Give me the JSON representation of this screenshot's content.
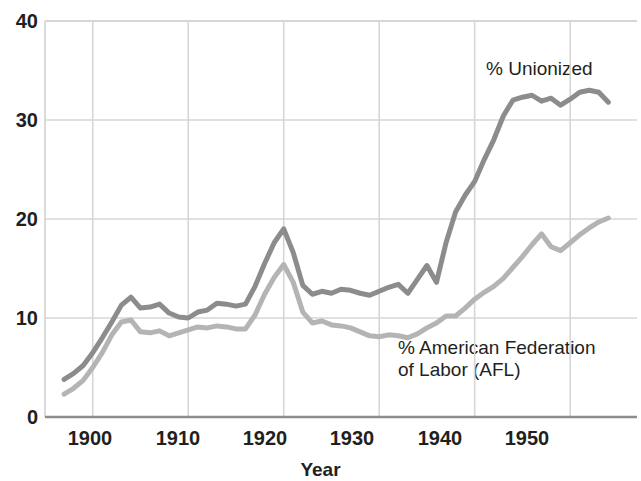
{
  "chart_data": {
    "type": "line",
    "title": "",
    "xlabel": "Year",
    "ylabel": "",
    "xlim": [
      1895,
      1957
    ],
    "ylim": [
      0,
      40
    ],
    "grid": true,
    "legend_position": "inline-annotations",
    "x_ticks": [
      1900,
      1910,
      1920,
      1930,
      1940,
      1950
    ],
    "y_ticks": [
      0,
      10,
      20,
      30,
      40
    ],
    "x": [
      1897,
      1898,
      1899,
      1900,
      1901,
      1902,
      1903,
      1904,
      1905,
      1906,
      1907,
      1908,
      1909,
      1910,
      1911,
      1912,
      1913,
      1914,
      1915,
      1916,
      1917,
      1918,
      1919,
      1920,
      1921,
      1922,
      1923,
      1924,
      1925,
      1926,
      1927,
      1928,
      1929,
      1930,
      1931,
      1932,
      1933,
      1934,
      1935,
      1936,
      1937,
      1938,
      1939,
      1940,
      1941,
      1942,
      1943,
      1944,
      1945,
      1946,
      1947,
      1948,
      1949,
      1950,
      1951,
      1952,
      1953,
      1954
    ],
    "series": [
      {
        "name": "% Unionized",
        "color": "#8c8c8c",
        "values": [
          3.8,
          4.4,
          5.2,
          6.5,
          8.0,
          9.6,
          11.3,
          12.1,
          11.0,
          11.1,
          11.4,
          10.5,
          10.1,
          10.0,
          10.6,
          10.8,
          11.5,
          11.4,
          11.2,
          11.4,
          13.2,
          15.5,
          17.6,
          19.0,
          16.6,
          13.3,
          12.4,
          12.7,
          12.5,
          12.9,
          12.8,
          12.5,
          12.3,
          12.7,
          13.1,
          13.4,
          12.5,
          13.9,
          15.3,
          13.6,
          17.6,
          20.7,
          22.4,
          23.8,
          26.0,
          28.0,
          30.4,
          32.0,
          32.3,
          32.5,
          31.9,
          32.2,
          31.5,
          32.1,
          32.8,
          33.0,
          32.8,
          31.8
        ]
      },
      {
        "name": "% American Federation\nof Labor (AFL)",
        "color": "#b4b4b4",
        "values": [
          2.3,
          2.9,
          3.7,
          5.0,
          6.5,
          8.3,
          9.6,
          9.8,
          8.6,
          8.5,
          8.7,
          8.2,
          8.5,
          8.8,
          9.1,
          9.0,
          9.2,
          9.1,
          8.9,
          8.9,
          10.3,
          12.4,
          14.1,
          15.4,
          13.6,
          10.6,
          9.5,
          9.7,
          9.3,
          9.2,
          9.0,
          8.6,
          8.2,
          8.1,
          8.3,
          8.2,
          8.0,
          8.4,
          9.0,
          9.5,
          10.2,
          10.2,
          11.0,
          11.9,
          12.6,
          13.2,
          14.0,
          15.1,
          16.2,
          17.4,
          18.5,
          17.2,
          16.8,
          17.6,
          18.4,
          19.1,
          19.7,
          20.1
        ]
      }
    ],
    "annotations": [
      {
        "text": "% Unionized",
        "x": 1944,
        "y": 36
      },
      {
        "text": "% American Federation\nof Labor (AFL)",
        "x": 1938,
        "y": 7
      }
    ]
  },
  "axes": {
    "y_labels": [
      "40",
      "30",
      "20",
      "10",
      "0"
    ],
    "x_labels": [
      "1900",
      "1910",
      "1920",
      "1930",
      "1940",
      "1950"
    ],
    "x_title": "Year"
  },
  "labels": {
    "unionized": "% Unionized",
    "afl_line1": "% American Federation",
    "afl_line2": "of Labor (AFL)"
  },
  "colors": {
    "unionized": "#8c8c8c",
    "afl": "#b4b4b4",
    "grid": "#d6d6d6",
    "axis": "#8d8d8d",
    "text": "#231f20",
    "background": "#ffffff"
  }
}
